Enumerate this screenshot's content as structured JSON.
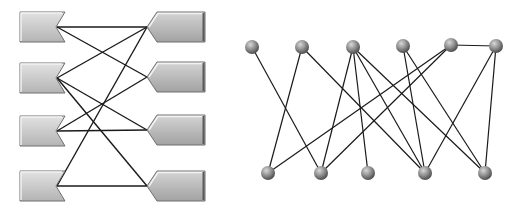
{
  "colors": {
    "background": "#ffffff",
    "edge": "#1a1a1a",
    "left_shape_fill_top": "#e2e2e2",
    "left_shape_fill_bottom": "#b4b4b4",
    "right_shape_fill_top": "#d4d4d4",
    "right_shape_fill_bottom": "#a2a2a2",
    "shape_edge_dark": "#6e6e6e",
    "shape_edge_light": "#f2f2f2",
    "node_light": "#d8d8d8",
    "node_mid": "#8c8c8c",
    "node_dark": "#4a4a4a"
  },
  "left_diagram": {
    "left_shapes": [
      {
        "id": "L1",
        "x": 20,
        "y": 12,
        "w": 45,
        "h": 30
      },
      {
        "id": "L2",
        "x": 20,
        "y": 63,
        "w": 45,
        "h": 30
      },
      {
        "id": "L3",
        "x": 20,
        "y": 116,
        "w": 45,
        "h": 30
      },
      {
        "id": "L4",
        "x": 20,
        "y": 171,
        "w": 45,
        "h": 30
      }
    ],
    "right_shapes": [
      {
        "id": "R1",
        "x": 147,
        "y": 12,
        "w": 58,
        "h": 30
      },
      {
        "id": "R2",
        "x": 147,
        "y": 62,
        "w": 58,
        "h": 30
      },
      {
        "id": "R3",
        "x": 147,
        "y": 115,
        "w": 58,
        "h": 30
      },
      {
        "id": "R4",
        "x": 147,
        "y": 171,
        "w": 58,
        "h": 30
      }
    ],
    "edges": [
      [
        "L1",
        "R1"
      ],
      [
        "L1",
        "R2"
      ],
      [
        "L2",
        "R1"
      ],
      [
        "L2",
        "R3"
      ],
      [
        "L2",
        "R4"
      ],
      [
        "L3",
        "R2"
      ],
      [
        "L3",
        "R3"
      ],
      [
        "L4",
        "R1"
      ],
      [
        "L4",
        "R4"
      ]
    ]
  },
  "right_diagram": {
    "node_radius": 7,
    "top_nodes": [
      {
        "id": "T1",
        "x": 252,
        "y": 47
      },
      {
        "id": "T2",
        "x": 302,
        "y": 47
      },
      {
        "id": "T3",
        "x": 353,
        "y": 47
      },
      {
        "id": "T4",
        "x": 403,
        "y": 46
      },
      {
        "id": "T5",
        "x": 451,
        "y": 45
      },
      {
        "id": "T6",
        "x": 496,
        "y": 46
      }
    ],
    "bottom_nodes": [
      {
        "id": "B1",
        "x": 268,
        "y": 173
      },
      {
        "id": "B2",
        "x": 321,
        "y": 173
      },
      {
        "id": "B3",
        "x": 368,
        "y": 173
      },
      {
        "id": "B4",
        "x": 425,
        "y": 173
      },
      {
        "id": "B5",
        "x": 485,
        "y": 173
      }
    ],
    "edges": [
      [
        "T1",
        "B2"
      ],
      [
        "T2",
        "B1"
      ],
      [
        "T2",
        "B4"
      ],
      [
        "T3",
        "B2"
      ],
      [
        "T3",
        "B3"
      ],
      [
        "T3",
        "B4"
      ],
      [
        "T3",
        "B5"
      ],
      [
        "T4",
        "B4"
      ],
      [
        "T4",
        "B5"
      ],
      [
        "T5",
        "B1"
      ],
      [
        "T5",
        "B2"
      ],
      [
        "T5",
        "T6"
      ],
      [
        "T6",
        "B4"
      ],
      [
        "T6",
        "B5"
      ]
    ]
  }
}
